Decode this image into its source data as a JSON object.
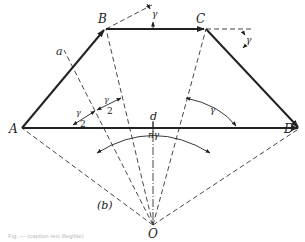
{
  "diagram": {
    "panel_label": "(b)",
    "points": {
      "A": {
        "label": "A",
        "x": 22,
        "y": 128
      },
      "B": {
        "label": "B",
        "x": 106,
        "y": 29
      },
      "C": {
        "label": "C",
        "x": 206,
        "y": 29
      },
      "D": {
        "label": "D",
        "x": 300,
        "y": 128
      },
      "O": {
        "label": "O",
        "x": 153,
        "y": 225
      }
    },
    "labels": {
      "side_a": "a",
      "chord_d": "d",
      "gamma_B": "γ",
      "gamma_C": "γ",
      "gamma_half_left_num": "γ",
      "gamma_half_left_den": "2",
      "gamma_half_right_num": "γ",
      "gamma_half_right_den": "2",
      "n_gamma": "nγ",
      "gamma_right": "γ"
    },
    "caption": "Fig. — (caption text illegible)",
    "colors": {
      "line": "#222222",
      "dashed": "#333333",
      "background": "#ffffff"
    }
  }
}
